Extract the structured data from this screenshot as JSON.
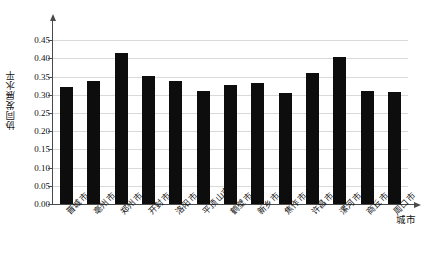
{
  "chart_data": {
    "type": "bar",
    "title": "",
    "xlabel": "城市",
    "ylabel": "协同发展水平",
    "ylim": [
      0.0,
      0.47
    ],
    "ytick_labels": [
      "0.00",
      "0.05",
      "0.10",
      "0.15",
      "0.20",
      "0.25",
      "0.30",
      "0.35",
      "0.40",
      "0.45"
    ],
    "ytick_values": [
      0.0,
      0.05,
      0.1,
      0.15,
      0.2,
      0.25,
      0.3,
      0.35,
      0.4,
      0.45
    ],
    "grid": true,
    "legend": "none",
    "bar_color": "#0d0d0d",
    "grid_color": "#d9d9d9",
    "axis_color": "#4a4a4a",
    "categories": [
      "晋城市",
      "亳州市",
      "郑州市",
      "开封市",
      "洛阳市",
      "平顶山市",
      "鹤壁市",
      "新乡市",
      "焦作市",
      "许昌市",
      "漯河市",
      "商丘市",
      "周口市"
    ],
    "values": [
      0.322,
      0.339,
      0.414,
      0.353,
      0.338,
      0.31,
      0.326,
      0.333,
      0.304,
      0.36,
      0.405,
      0.312,
      0.308
    ]
  }
}
